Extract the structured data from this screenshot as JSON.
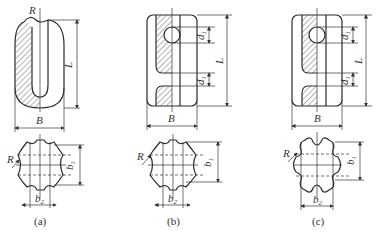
{
  "figure": {
    "panels": [
      {
        "id": "a",
        "caption": "(a)",
        "top_view": {
          "labels": {
            "radius": "R",
            "length": "L",
            "width": "B"
          }
        },
        "section_view": {
          "labels": {
            "radius": "R",
            "height": "b",
            "height_sub": "1",
            "width": "b",
            "width_sub": "2"
          }
        }
      },
      {
        "id": "b",
        "caption": "(b)",
        "top_view": {
          "labels": {
            "d_upper": "d",
            "d_upper_sub": "1",
            "d_lower": "d",
            "d_lower_sub": "1",
            "length": "L",
            "width": "B"
          }
        },
        "section_view": {
          "labels": {
            "radius": "R",
            "height": "b",
            "height_sub": "1",
            "width": "b",
            "width_sub": "2"
          }
        }
      },
      {
        "id": "c",
        "caption": "(c)",
        "top_view": {
          "labels": {
            "d_upper": "d",
            "d_upper_sub": "1",
            "d_lower": "d",
            "d_lower_sub": "1",
            "length": "L",
            "width": "B"
          }
        },
        "section_view": {
          "labels": {
            "radius": "R",
            "height": "b",
            "height_sub": "1",
            "width": "b",
            "width_sub": "2"
          }
        }
      }
    ],
    "colors": {
      "line": "#2b2b2b",
      "text": "#333333",
      "background": "#ffffff"
    }
  }
}
